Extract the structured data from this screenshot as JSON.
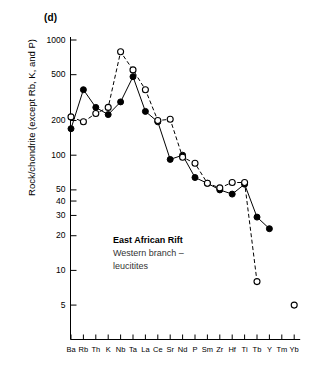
{
  "figure": {
    "panel_label": "(d)",
    "ylabel": "Rock/chondrite (except Rb, K, and P)"
  },
  "annotation": {
    "title": "East African Rift",
    "line2": "Western branch –",
    "line3": "leucitites"
  },
  "chart_data": {
    "type": "line",
    "title": "(d)",
    "xlabel": "",
    "ylabel": "Rock/chondrite (except Rb, K, and P)",
    "yscale": "log",
    "ylim": [
      4,
      1300
    ],
    "grid": false,
    "legend": "none",
    "y_ticks": [
      1000,
      500,
      200,
      100,
      50,
      40,
      30,
      20,
      10,
      5
    ],
    "y_tick_labels": [
      "1000",
      "500",
      "200",
      "100",
      "50",
      "40",
      "30",
      "20",
      "10",
      "5"
    ],
    "categories": [
      "Ba",
      "Rb",
      "Th",
      "K",
      "Nb",
      "Ta",
      "La",
      "Ce",
      "Sr",
      "Nd",
      "P",
      "Sm",
      "Zr",
      "Hf",
      "Ti",
      "Tb",
      "Y",
      "Tm",
      "Yb"
    ],
    "series": [
      {
        "name": "filled-circles",
        "marker": "filled-circle",
        "linestyle": "solid",
        "color": "#000000",
        "values": [
          170,
          370,
          260,
          225,
          290,
          480,
          240,
          195,
          92,
          100,
          64,
          57,
          50,
          46,
          56,
          29,
          23,
          null,
          null
        ]
      },
      {
        "name": "open-circles",
        "marker": "open-circle",
        "linestyle": "dashed",
        "color": "#000000",
        "values": [
          215,
          195,
          230,
          260,
          790,
          550,
          370,
          200,
          205,
          96,
          85,
          57,
          52,
          58,
          58,
          8,
          null,
          null,
          5
        ]
      }
    ]
  }
}
